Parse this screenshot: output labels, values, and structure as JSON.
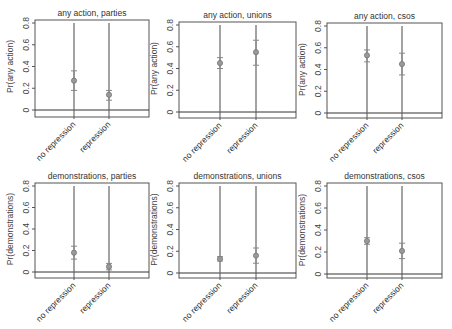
{
  "chart_data": [
    {
      "type": "scatter",
      "title": "any action, parties",
      "ylabel": "Pr(any action)",
      "ylim": [
        0,
        0.8
      ],
      "yticks": [
        "0",
        "0.2",
        "0.4",
        "0.6",
        "0.8"
      ],
      "categories": [
        "no repression",
        "repression"
      ],
      "values": [
        0.27,
        0.14
      ],
      "ci_low": [
        0.18,
        0.09
      ],
      "ci_high": [
        0.36,
        0.18
      ]
    },
    {
      "type": "scatter",
      "title": "any action, unions",
      "ylabel": "Pr(any action)",
      "ylim": [
        0,
        0.8
      ],
      "yticks": [
        "0",
        "0.2",
        "0.4",
        "0.6",
        "0.8"
      ],
      "categories": [
        "no repression",
        "repression"
      ],
      "values": [
        0.45,
        0.55
      ],
      "ci_low": [
        0.4,
        0.43
      ],
      "ci_high": [
        0.5,
        0.66
      ]
    },
    {
      "type": "scatter",
      "title": "any action, csos",
      "ylabel": "Pr(any action)",
      "ylim": [
        0,
        0.8
      ],
      "yticks": [
        "0",
        "0.2",
        "0.4",
        "0.6",
        "0.8"
      ],
      "categories": [
        "no repression",
        "repression"
      ],
      "values": [
        0.53,
        0.45
      ],
      "ci_low": [
        0.47,
        0.35
      ],
      "ci_high": [
        0.58,
        0.55
      ]
    },
    {
      "type": "scatter",
      "title": "demonstrations, parties",
      "ylabel": "Pr(demonstrations)",
      "ylim": [
        0,
        0.8
      ],
      "yticks": [
        "0",
        "0.2",
        "0.4",
        "0.6",
        "0.8"
      ],
      "categories": [
        "no repression",
        "repression"
      ],
      "values": [
        0.18,
        0.05
      ],
      "ci_low": [
        0.12,
        0.02
      ],
      "ci_high": [
        0.24,
        0.08
      ]
    },
    {
      "type": "scatter",
      "title": "demonstrations, unions",
      "ylabel": "Pr(demonstrations)",
      "ylim": [
        0,
        0.8
      ],
      "yticks": [
        "0",
        "0.2",
        "0.4",
        "0.6",
        "0.8"
      ],
      "categories": [
        "no repression",
        "repression"
      ],
      "values": [
        0.13,
        0.16
      ],
      "ci_low": [
        0.11,
        0.09
      ],
      "ci_high": [
        0.15,
        0.23
      ]
    },
    {
      "type": "scatter",
      "title": "demonstrations, csos",
      "ylabel": "Pr(demonstrations)",
      "ylim": [
        0,
        0.8
      ],
      "yticks": [
        "0",
        "0.2",
        "0.4",
        "0.6",
        "0.8"
      ],
      "categories": [
        "no repression",
        "repression"
      ],
      "values": [
        0.3,
        0.21
      ],
      "ci_low": [
        0.27,
        0.14
      ],
      "ci_high": [
        0.33,
        0.28
      ]
    }
  ]
}
